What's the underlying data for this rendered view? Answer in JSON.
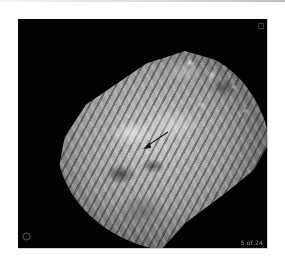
{
  "image": {
    "description": "Grayscale MRI slice with annotation arrow",
    "background_color": "#020202",
    "annotation": {
      "type": "arrow",
      "color": "#1a1a1a",
      "direction": "down-left"
    },
    "marker_icon": "circle-marker-icon",
    "slice_indicator": "5 of 24"
  }
}
